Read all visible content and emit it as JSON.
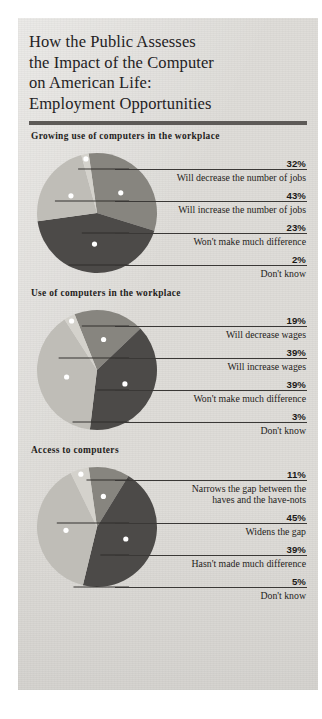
{
  "title": {
    "lines": [
      "How the Public Assesses",
      "the Impact of the Computer",
      "on American Life:",
      "Employment Opportunities"
    ]
  },
  "colors": {
    "paper": "#dedcd8",
    "rule": "#5d5a57",
    "slice_dark": "#4c4a48",
    "slice_medium": "#87857f",
    "slice_light": "#bfbdb7",
    "leader": "#2f2d2b",
    "dot": "#ffffff",
    "text": "#1f1d1b"
  },
  "chart_data": [
    {
      "type": "pie",
      "title": "Growing use of computers in the workplace",
      "labels": [
        "Will decrease the number of jobs",
        "Will increase the number of jobs",
        "Won't make much difference",
        "Don't know"
      ],
      "values": [
        32,
        43,
        23,
        2
      ],
      "value_labels": [
        "32%",
        "43%",
        "23%",
        "2%"
      ],
      "slice_colors": [
        "#87857f",
        "#4c4a48",
        "#bfbdb7",
        "#d4d2cc"
      ],
      "legend": "callout-lines-right"
    },
    {
      "type": "pie",
      "title": "Use of computers in the workplace",
      "labels": [
        "Will decrease wages",
        "Will increase wages",
        "Won't make much difference",
        "Don't know"
      ],
      "values": [
        19,
        39,
        39,
        3
      ],
      "value_labels": [
        "19%",
        "39%",
        "39%",
        "3%"
      ],
      "slice_colors": [
        "#87857f",
        "#4c4a48",
        "#bfbdb7",
        "#d4d2cc"
      ],
      "legend": "callout-lines-right"
    },
    {
      "type": "pie",
      "title": "Access to computers",
      "labels": [
        "Narrows the gap between the haves and the have-nots",
        "Widens the gap",
        "Hasn't made much difference",
        "Don't know"
      ],
      "labels_wrapped": [
        [
          "Narrows the gap between the",
          "haves and the have-nots"
        ],
        [
          "Widens the gap"
        ],
        [
          "Hasn't made much difference"
        ],
        [
          "Don't know"
        ]
      ],
      "values": [
        11,
        45,
        39,
        5
      ],
      "value_labels": [
        "11%",
        "45%",
        "39%",
        "5%"
      ],
      "slice_colors": [
        "#87857f",
        "#4c4a48",
        "#bfbdb7",
        "#d4d2cc"
      ],
      "legend": "callout-lines-right"
    }
  ]
}
